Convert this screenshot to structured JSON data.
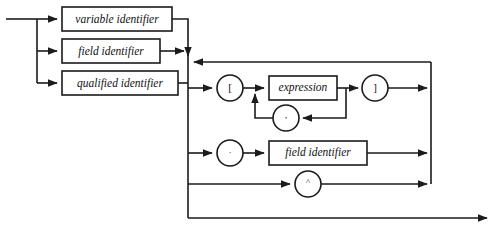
{
  "diagram": {
    "kind": "railroad-syntax-diagram",
    "colors": {
      "stroke": "#1b1b1b",
      "box_fill": "#ffffff",
      "background": "#ffffff"
    },
    "nonterminals": [
      {
        "id": "variable-identifier",
        "label": "variable identifier"
      },
      {
        "id": "field-identifier-left",
        "label": "field identifier"
      },
      {
        "id": "qualified-identifier",
        "label": "qualified identifier"
      },
      {
        "id": "expression",
        "label": "expression"
      },
      {
        "id": "field-identifier-right",
        "label": "field identifier"
      }
    ],
    "terminals": [
      {
        "id": "open-bracket",
        "label": "["
      },
      {
        "id": "close-bracket",
        "label": "]"
      },
      {
        "id": "comma",
        "label": ","
      },
      {
        "id": "period",
        "label": "."
      },
      {
        "id": "caret",
        "label": "^"
      }
    ],
    "branches": {
      "first_choice": [
        "variable identifier",
        "field identifier",
        "qualified identifier"
      ],
      "second_choice": [
        "[ expression , ]",
        ". field identifier",
        "^"
      ]
    }
  }
}
